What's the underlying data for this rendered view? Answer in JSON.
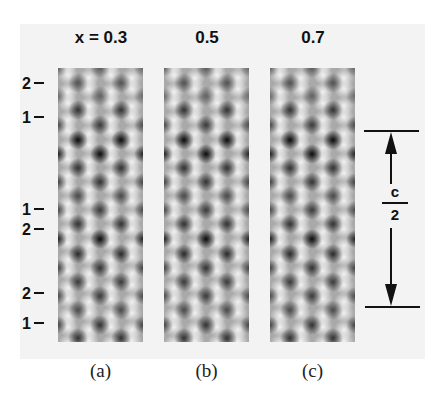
{
  "figure": {
    "column_titles": [
      "x = 0.3",
      "0.5",
      "0.7"
    ],
    "panel_captions": [
      "(a)",
      "(b)",
      "(c)"
    ],
    "row_labels": [
      {
        "text": "2",
        "y": 84
      },
      {
        "text": "1",
        "y": 118
      },
      {
        "text": "1",
        "y": 210
      },
      {
        "text": "2",
        "y": 230
      },
      {
        "text": "2",
        "y": 294
      },
      {
        "text": "1",
        "y": 324
      }
    ],
    "dimension_marker": {
      "numerator": "c",
      "denominator": "2",
      "top_y": 131,
      "bottom_y": 307
    },
    "panels": [
      {
        "id": "a",
        "x": 58,
        "contrast": 1.0
      },
      {
        "id": "b",
        "x": 164,
        "contrast": 1.0
      },
      {
        "id": "c",
        "x": 270,
        "contrast": 0.95
      }
    ],
    "lattice": {
      "background_gray": "#a9a9a9",
      "bright_color": "#f4f4f4",
      "dark_color": "#0a0a0a",
      "side_columns_x": [
        20,
        63
      ],
      "center_column_x": 42,
      "edge_columns_x": [
        0,
        85
      ],
      "side_rows_y": [
        15,
        42,
        72,
        100,
        128,
        156,
        186,
        214,
        242,
        270
      ],
      "side_darkness": [
        0.55,
        0.75,
        1.0,
        0.75,
        0.6,
        0.75,
        0.8,
        0.7,
        0.6,
        0.75
      ],
      "center_rows_y": [
        0,
        28,
        57,
        86,
        114,
        142,
        171,
        200,
        228,
        257
      ],
      "center_darkness": [
        0.5,
        0.45,
        0.7,
        1.0,
        0.75,
        0.7,
        1.0,
        0.75,
        0.7,
        0.75
      ]
    }
  }
}
